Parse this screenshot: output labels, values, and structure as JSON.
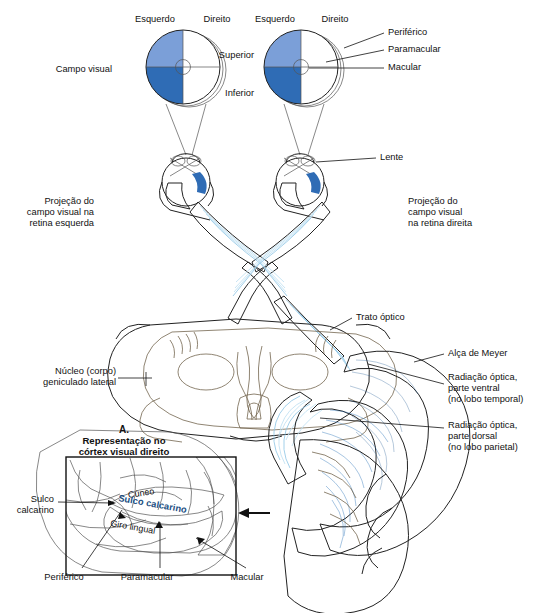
{
  "figure": {
    "language": "pt-BR"
  },
  "colors": {
    "light_blue_field": "#7b9fd8",
    "dark_blue_field": "#2f6cb5",
    "radiation_dark": "#1f6cb5",
    "radiation_pale": "#b8dcf0",
    "fiber_pale": "#cfe7f5",
    "brain_tan": "#c9bda3",
    "brain_light": "#ece5d4",
    "cortex_cream": "#e8e0cd",
    "outline": "#222222",
    "text": "#111111"
  },
  "labels": {
    "campo_visual": "Campo visual",
    "esquerdo_left": "Esquerdo",
    "direito_left": "Direito",
    "esquerdo_right": "Esquerdo",
    "direito_right": "Direito",
    "superior": "Superior",
    "inferior": "Inferior",
    "periferico_top": "Periférico",
    "paramacular_top": "Paramacular",
    "macular_top": "Macular",
    "lente": "Lente",
    "projecao_esquerda_l1": "Projeção do",
    "projecao_esquerda_l2": "campo visual na",
    "projecao_esquerda_l3": "retina esquerda",
    "projecao_direita_l1": "Projeção do",
    "projecao_direita_l2": "campo visual",
    "projecao_direita_l3": "na retina direita",
    "trato_optico": "Trato óptico",
    "nucleo_l1": "Núcleo (corpo)",
    "nucleo_l2": "geniculado lateral",
    "alca_meyer": "Alça de Meyer",
    "radiacao_ventral_l1": "Radiação óptica,",
    "radiacao_ventral_l2": "parte ventral",
    "radiacao_ventral_l3": "(no lobo temporal)",
    "radiacao_dorsal_l1": "Radiação óptica,",
    "radiacao_dorsal_l2": "parte dorsal",
    "radiacao_dorsal_l3": "(no lobo parietal)",
    "panel_letter": "A.",
    "panel_title_l1": "Representação no",
    "panel_title_l2": "córtex visual direito",
    "cuneo": "Cúneo",
    "sulco_calcarino_inner": "Sulco calcarino",
    "giro_lingual": "Giro lingual",
    "sulco_calcarino_l1": "Sulco",
    "sulco_calcarino_l2": "calcarino",
    "periferico_bottom": "Periférico",
    "paramacular_bottom": "Paramacular",
    "macular_bottom": "Macular"
  }
}
